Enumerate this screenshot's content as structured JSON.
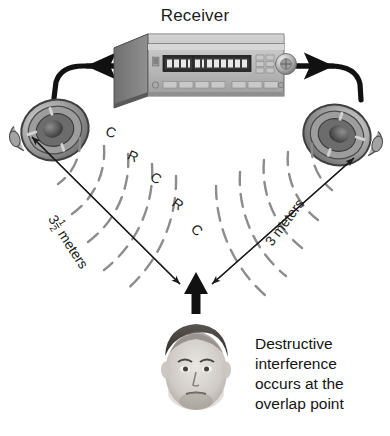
{
  "diagram": {
    "title": "Receiver",
    "background_color": "#ffffff",
    "ink_color": "#1b1b1b",
    "wave_color": "#8c8c8c"
  },
  "equipment": {
    "receiver_label": "Receiver",
    "left_speaker_name": "left-speaker",
    "right_speaker_name": "right-speaker",
    "left_cable_name": "left-speaker-cable",
    "right_cable_name": "right-speaker-cable"
  },
  "dimensions": {
    "left": {
      "whole": "3",
      "numerator": "1",
      "denominator": "2",
      "unit": "meters"
    },
    "right": {
      "value": "3 meters"
    }
  },
  "wave_labels": {
    "left": [
      "C",
      "R",
      "C",
      "R",
      "C"
    ],
    "right": [
      "C",
      "R",
      "C"
    ]
  },
  "caption": {
    "line1": "Destructive",
    "line2": "interference",
    "line3": "occurs at the",
    "line4": "overlap point"
  }
}
